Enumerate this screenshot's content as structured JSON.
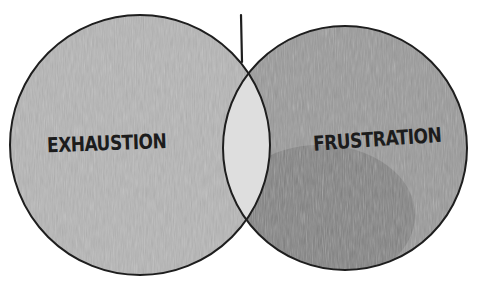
{
  "diagram": {
    "type": "venn",
    "style": "hand-drawn pencil sketch",
    "sets": [
      {
        "label": "EXHAUSTION",
        "fill": "#b4b4b4"
      },
      {
        "label": "FRUSTRATION",
        "fill": "#8f8f8f"
      }
    ],
    "intersection": {
      "label": "",
      "fill": "#dcdcdc"
    },
    "colors": {
      "outline": "#1e1e1e",
      "background": "#ffffff",
      "text": "#1c1c1c"
    }
  }
}
